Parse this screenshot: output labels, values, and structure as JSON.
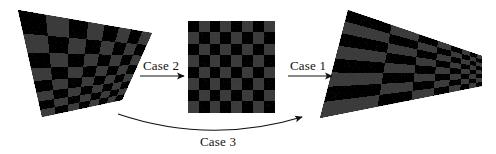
{
  "figure": {
    "background_color": "#ffffff",
    "width": 496,
    "height": 154
  },
  "labels": {
    "case1": "Case 1",
    "case2": "Case 2",
    "case3": "Case 3"
  },
  "colors": {
    "dark_square": "#2b2b2b",
    "light_square": "#7b7b7b",
    "arrow": "#121212",
    "text": "#121212",
    "background": "#ffffff"
  },
  "boards": [
    {
      "name": "left-distorted-board",
      "role": "input-distorted-checkerboard",
      "rows": 8,
      "cols": 8,
      "corners": [
        [
          18,
          10
        ],
        [
          152,
          33
        ],
        [
          122,
          100
        ],
        [
          42,
          117
        ]
      ],
      "noise": true
    },
    {
      "name": "middle-rectified-board",
      "role": "rectified-frontal-checkerboard",
      "rows": 8,
      "cols": 8,
      "corners": [
        [
          188,
          21
        ],
        [
          275,
          21
        ],
        [
          275,
          113
        ],
        [
          188,
          113
        ]
      ],
      "noise": true
    },
    {
      "name": "right-perspective-board",
      "role": "output-perspective-checkerboard",
      "rows": 8,
      "cols": 8,
      "corners": [
        [
          348,
          10
        ],
        [
          482,
          56
        ],
        [
          482,
          86
        ],
        [
          320,
          118
        ]
      ],
      "noise": true
    }
  ],
  "arrows": [
    {
      "name": "case2-arrow",
      "type": "straight",
      "from": [
        140,
        76
      ],
      "to": [
        184,
        76
      ],
      "label": "Case 2"
    },
    {
      "name": "case1-arrow",
      "type": "straight",
      "from": [
        288,
        76
      ],
      "to": [
        332,
        76
      ],
      "label": "Case 1"
    },
    {
      "name": "case3-arrow",
      "type": "curved",
      "from": [
        118,
        114
      ],
      "control": [
        210,
        145
      ],
      "to": [
        302,
        117
      ],
      "label": "Case 3"
    }
  ],
  "chart_data": {
    "type": "diagram",
    "nodes": [
      {
        "id": "left",
        "label": "distorted checkerboard (quadrilateral)"
      },
      {
        "id": "middle",
        "label": "rectified checkerboard (square, 8x8)"
      },
      {
        "id": "right",
        "label": "perspective-projected checkerboard"
      }
    ],
    "edges": [
      {
        "from": "left",
        "to": "middle",
        "label": "Case 2"
      },
      {
        "from": "middle",
        "to": "right",
        "label": "Case 1"
      },
      {
        "from": "left",
        "to": "right",
        "label": "Case 3"
      }
    ]
  }
}
